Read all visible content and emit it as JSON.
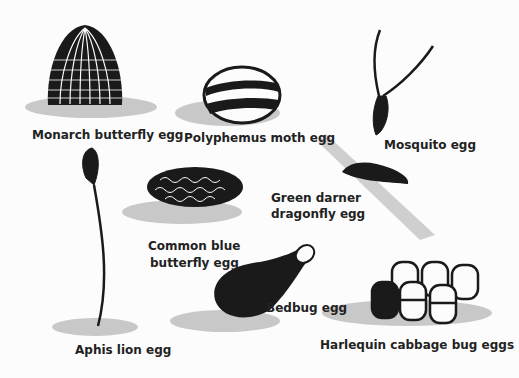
{
  "figure": {
    "type": "illustration",
    "items": [
      {
        "id": "monarch",
        "label": "Monarch butterfly egg"
      },
      {
        "id": "polyphemus",
        "label": "Polyphemus moth egg"
      },
      {
        "id": "mosquito",
        "label": "Mosquito egg"
      },
      {
        "id": "green_darner",
        "label_line1": "Green darner",
        "label_line2": "dragonfly egg"
      },
      {
        "id": "common_blue",
        "label_line1": "Common blue",
        "label_line2": "butterfly egg"
      },
      {
        "id": "aphis_lion",
        "label": "Aphis lion egg"
      },
      {
        "id": "bedbug",
        "label": "Bedbug egg"
      },
      {
        "id": "harlequin",
        "label": "Harlequin cabbage bug eggs"
      }
    ],
    "colors": {
      "ink": "#1a1a1a",
      "shadow": "#c8c8c8",
      "background": "#fcfcfc"
    }
  }
}
